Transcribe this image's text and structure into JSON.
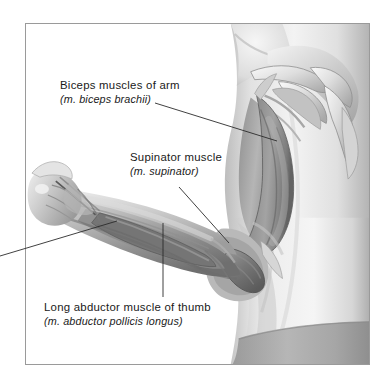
{
  "figure": {
    "frame": {
      "x": 25,
      "y": 23,
      "width": 345,
      "height": 342,
      "border_color": "#9a9a9a",
      "background": "#ffffff"
    },
    "style": "grayscale anatomical illustration",
    "palette": {
      "skin_light": "#f2f2f2",
      "skin_mid": "#cfcfcf",
      "skin_shadow": "#9d9d9d",
      "muscle_mid": "#8a8a8a",
      "muscle_dark": "#5f5f5f",
      "tendon_light": "#e6e6e6",
      "outline": "#6b6b6b",
      "waistband": "#a8a8a8",
      "leader_line": "#2b2b2b",
      "text": "#1a1a1a"
    }
  },
  "callouts": [
    {
      "id": "biceps",
      "primary": "Biceps muscles of arm",
      "latin": "(m. biceps brachii)",
      "leader": {
        "x1": 155,
        "y1": 103,
        "x2": 277,
        "y2": 141
      }
    },
    {
      "id": "supinator",
      "primary": "Supinator muscle",
      "latin": "(m. supinator)",
      "leader": {
        "x1": 179,
        "y1": 187,
        "x2": 229,
        "y2": 243
      }
    },
    {
      "id": "abductor",
      "primary": "Long abductor muscle of thumb",
      "latin": "(m. abductor pollicis longus)",
      "leader": {
        "x1": 163,
        "y1": 223,
        "x2": 163,
        "y2": 297
      }
    }
  ],
  "extra_leaders": [
    {
      "id": "offscreen-left",
      "x1": 0,
      "y1": 256,
      "x2": 117,
      "y2": 221
    }
  ],
  "anatomy_parts": [
    "shoulder",
    "clavicle",
    "scapula-spine",
    "deltoid-region",
    "biceps-brachii",
    "brachialis",
    "elbow",
    "forearm",
    "supinator",
    "abductor-pollicis-longus",
    "wrist",
    "hand",
    "torso",
    "waistband"
  ]
}
